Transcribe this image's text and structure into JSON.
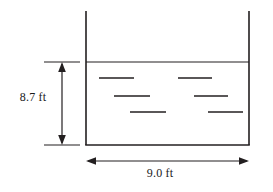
{
  "figure": {
    "type": "engineering-diagram",
    "stroke_color": "#231f20",
    "background_color": "#ffffff"
  },
  "dimensions": {
    "height": {
      "label": "8.7 ft",
      "value": 8.7,
      "unit": "ft",
      "orientation": "vertical",
      "position": "left",
      "measures": "water depth from water surface to tank bottom"
    },
    "width": {
      "label": "9.0 ft",
      "value": 9.0,
      "unit": "ft",
      "orientation": "horizontal",
      "position": "bottom",
      "measures": "tank inside width"
    }
  },
  "tank": {
    "left_wall_x": 86,
    "right_wall_x": 249,
    "wall_top_y": 11,
    "bottom_y": 145,
    "water_surface_y": 62
  },
  "water_marks": {
    "count": 6,
    "description": "short horizontal dashes indicating liquid inside the tank",
    "segments": [
      {
        "x1": 99,
        "x2": 134,
        "y": 78
      },
      {
        "x1": 178,
        "x2": 212,
        "y": 78
      },
      {
        "x1": 114,
        "x2": 150,
        "y": 96
      },
      {
        "x1": 194,
        "x2": 228,
        "y": 96
      },
      {
        "x1": 130,
        "x2": 166,
        "y": 112
      },
      {
        "x1": 208,
        "x2": 243,
        "y": 112
      }
    ]
  }
}
